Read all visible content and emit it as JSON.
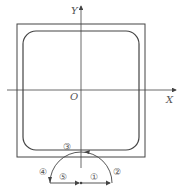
{
  "diagram": {
    "axes": {
      "x_label": "X",
      "y_label": "Y",
      "origin_label": "O"
    },
    "path_markers": [
      {
        "id": "1",
        "label": "①"
      },
      {
        "id": "2",
        "label": "②"
      },
      {
        "id": "3",
        "label": "③"
      },
      {
        "id": "4",
        "label": "④"
      },
      {
        "id": "5",
        "label": "⑤"
      }
    ],
    "colors": {
      "stroke": "#444444",
      "background": "#ffffff"
    }
  }
}
